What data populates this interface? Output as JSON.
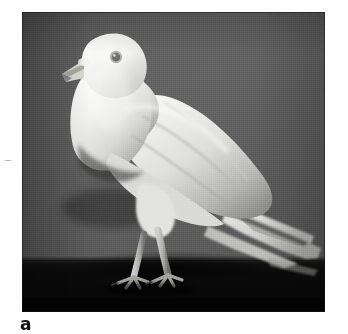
{
  "figure": {
    "caption_label": "a",
    "photo": {
      "alt_name": "white-pouter-pigeon-photo",
      "subject": "White pouter pigeon standing in profile facing left",
      "medium": "black-and-white photograph",
      "colors": {
        "background_top": "#5f5f5f",
        "background_bottom": "#4a4a4a",
        "floor_dark": "#0a0a0a",
        "bird_highlight": "#f4f4f2",
        "bird_midtone": "#d2d2ce",
        "bird_shadow": "#8e8e8a",
        "eye_dark": "#1b1b1b",
        "frame_edge": "#1e1e1e",
        "page_background": "#ffffff"
      },
      "geometry": {
        "frame_left": 22,
        "frame_top": 12,
        "frame_width": 303,
        "frame_height": 300,
        "horizon_y": 250
      }
    }
  }
}
